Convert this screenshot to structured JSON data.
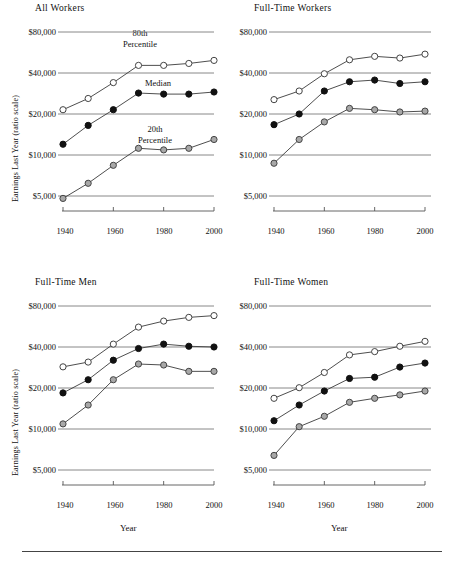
{
  "figure": {
    "y_axis_label": "Earnings Last Year (ratio scale)",
    "x_axis_label": "Year",
    "y_ticks": [
      "$80,000",
      "$40,000",
      "$20,000",
      "$10,000",
      "$5,000"
    ],
    "x_ticks": [
      "1940",
      "1960",
      "1980",
      "2000"
    ],
    "annotations": {
      "p80_line1": "80th",
      "p80_line2": "Percentile",
      "median": "Median",
      "p20_line1": "20th",
      "p20_line2": "Percentile"
    },
    "colors": {
      "p80_marker": "#ffffff",
      "median_marker": "#111111",
      "p20_marker": "#a8a8a8",
      "line": "#3a3a3a",
      "gridline": "#7a7a7a"
    }
  },
  "panels": [
    {
      "title": "All Workers"
    },
    {
      "title": "Full-Time Workers"
    },
    {
      "title": "Full-Time Men"
    },
    {
      "title": "Full-Time Women"
    }
  ],
  "chart_data": [
    {
      "type": "line",
      "title": "All Workers",
      "xlabel": "Year",
      "ylabel": "Earnings Last Year (ratio scale)",
      "yscale": "log",
      "ylim": [
        4000,
        90000
      ],
      "ytick_values": [
        80000,
        40000,
        20000,
        10000,
        5000
      ],
      "ytick_labels": [
        "$80,000",
        "$40,000",
        "$20,000",
        "$10,000",
        "$5,000"
      ],
      "x": [
        1940,
        1950,
        1960,
        1970,
        1980,
        1990,
        2000
      ],
      "xtick_values": [
        1940,
        1960,
        1980,
        2000
      ],
      "grid": true,
      "legend": "in-plot annotations",
      "series": [
        {
          "name": "80th Percentile",
          "marker": "open-circle",
          "values": [
            21500,
            26000,
            34000,
            45500,
            45500,
            47000,
            49500
          ]
        },
        {
          "name": "Median",
          "marker": "filled-black-circle",
          "values": [
            12000,
            16500,
            21500,
            28500,
            28000,
            28000,
            29000
          ]
        },
        {
          "name": "20th Percentile",
          "marker": "gray-circle",
          "values": [
            4800,
            6200,
            8400,
            11200,
            10900,
            11200,
            13000
          ]
        }
      ]
    },
    {
      "type": "line",
      "title": "Full-Time Workers",
      "xlabel": "Year",
      "ylabel": "Earnings Last Year (ratio scale)",
      "yscale": "log",
      "ylim": [
        4000,
        90000
      ],
      "ytick_values": [
        80000,
        40000,
        20000,
        10000,
        5000
      ],
      "ytick_labels": [
        "$80,000",
        "$40,000",
        "$20,000",
        "$10,000",
        "$5,000"
      ],
      "x": [
        1940,
        1950,
        1960,
        1970,
        1980,
        1990,
        2000
      ],
      "xtick_values": [
        1940,
        1960,
        1980,
        2000
      ],
      "grid": true,
      "series": [
        {
          "name": "80th Percentile",
          "marker": "open-circle",
          "values": [
            25500,
            29500,
            39500,
            50000,
            53000,
            51500,
            55000
          ]
        },
        {
          "name": "Median",
          "marker": "filled-black-circle",
          "values": [
            16700,
            20000,
            29500,
            34500,
            35500,
            33500,
            34500
          ]
        },
        {
          "name": "20th Percentile",
          "marker": "gray-circle",
          "values": [
            8700,
            13000,
            17500,
            22000,
            21500,
            20700,
            21000
          ]
        }
      ]
    },
    {
      "type": "line",
      "title": "Full-Time Men",
      "xlabel": "Year",
      "ylabel": "Earnings Last Year (ratio scale)",
      "yscale": "log",
      "ylim": [
        4000,
        90000
      ],
      "ytick_values": [
        80000,
        40000,
        20000,
        10000,
        5000
      ],
      "ytick_labels": [
        "$80,000",
        "$40,000",
        "$20,000",
        "$10,000",
        "$5,000"
      ],
      "x": [
        1940,
        1950,
        1960,
        1970,
        1980,
        1990,
        2000
      ],
      "xtick_values": [
        1940,
        1960,
        1980,
        2000
      ],
      "grid": true,
      "series": [
        {
          "name": "80th Percentile",
          "marker": "open-circle",
          "values": [
            28600,
            31000,
            42000,
            56000,
            62000,
            66000,
            68000
          ]
        },
        {
          "name": "Median",
          "marker": "filled-black-circle",
          "values": [
            18400,
            23000,
            32000,
            39000,
            42000,
            40500,
            40000
          ]
        },
        {
          "name": "20th Percentile",
          "marker": "gray-circle",
          "values": [
            10900,
            15000,
            23000,
            30000,
            29500,
            26500,
            26500
          ]
        }
      ]
    },
    {
      "type": "line",
      "title": "Full-Time Women",
      "xlabel": "Year",
      "ylabel": "Earnings Last Year (ratio scale)",
      "yscale": "log",
      "ylim": [
        4000,
        90000
      ],
      "ytick_values": [
        80000,
        40000,
        20000,
        10000,
        5000
      ],
      "ytick_labels": [
        "$80,000",
        "$40,000",
        "$20,000",
        "$10,000",
        "$5,000"
      ],
      "x": [
        1940,
        1950,
        1960,
        1970,
        1980,
        1990,
        2000
      ],
      "xtick_values": [
        1940,
        1960,
        1980,
        2000
      ],
      "grid": true,
      "series": [
        {
          "name": "80th Percentile",
          "marker": "open-circle",
          "values": [
            16800,
            20100,
            26000,
            35000,
            37000,
            40500,
            44000
          ]
        },
        {
          "name": "Median",
          "marker": "filled-black-circle",
          "values": [
            11500,
            15000,
            19000,
            23500,
            24000,
            28500,
            30500
          ]
        },
        {
          "name": "20th Percentile",
          "marker": "gray-circle",
          "values": [
            6400,
            10400,
            12400,
            15700,
            16800,
            17800,
            19000
          ]
        }
      ]
    }
  ]
}
